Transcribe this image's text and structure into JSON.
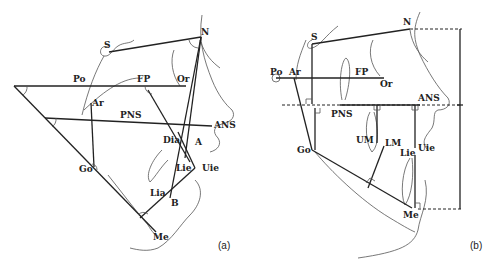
{
  "panels": [
    {
      "caption": "(a)",
      "labels": {
        "S": "S",
        "N": "N",
        "Po": "Po",
        "FP": "FP",
        "Or": "Or",
        "Ar": "Ar",
        "PNS": "PNS",
        "ANS": "ANS",
        "Dia": "Dia",
        "A": "A",
        "Go": "Go",
        "Lie": "Lie",
        "Uie": "Uie",
        "Lia": "Lia",
        "B": "B",
        "Me": "Me"
      }
    },
    {
      "caption": "(b)",
      "labels": {
        "S": "S",
        "N": "N",
        "Po": "Po",
        "Ar": "Ar",
        "FP": "FP",
        "Or": "Or",
        "ANS": "ANS",
        "PNS": "PNS",
        "UM": "UM",
        "LM": "LM",
        "Go": "Go",
        "Lie": "Lie",
        "Uie": "Uie",
        "Me": "Me"
      }
    }
  ]
}
